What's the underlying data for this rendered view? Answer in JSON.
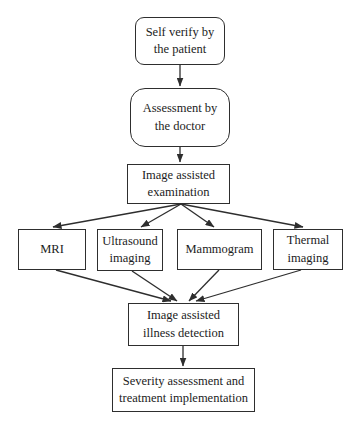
{
  "diagram": {
    "type": "flowchart",
    "colors": {
      "line": "#2e2e2e",
      "text": "#1c1c1c",
      "background": "#ffffff"
    },
    "nodes": {
      "self_verify": {
        "shape": "rounded-rect",
        "label": "Self verify by the patient",
        "lines": [
          "Self verify by",
          "the patient"
        ]
      },
      "assessment": {
        "shape": "rounded-rect",
        "label": "Assessment by the doctor",
        "lines": [
          "Assessment by",
          "the doctor"
        ]
      },
      "examination": {
        "shape": "rect",
        "label": "Image assisted examination",
        "lines": [
          "Image assisted",
          "examination"
        ]
      },
      "mri": {
        "shape": "rect",
        "label": "MRI",
        "lines": [
          "MRI"
        ]
      },
      "ultrasound": {
        "shape": "rect",
        "label": "Ultrasound imaging",
        "lines": [
          "Ultrasound",
          "imaging"
        ]
      },
      "mammogram": {
        "shape": "rect",
        "label": "Mammogram",
        "lines": [
          "Mammogram"
        ]
      },
      "thermal": {
        "shape": "rect",
        "label": "Thermal imaging",
        "lines": [
          "Thermal",
          "imaging"
        ]
      },
      "detection": {
        "shape": "rect",
        "label": "Image assisted illness detection",
        "lines": [
          "Image assisted",
          "illness detection"
        ]
      },
      "severity": {
        "shape": "rect",
        "label": "Severity assessment and treatment implementation",
        "lines": [
          "Severity assessment and",
          "treatment implementation"
        ]
      }
    },
    "edges": [
      {
        "from": "self_verify",
        "to": "assessment"
      },
      {
        "from": "assessment",
        "to": "examination"
      },
      {
        "from": "examination",
        "to": "mri"
      },
      {
        "from": "examination",
        "to": "ultrasound"
      },
      {
        "from": "examination",
        "to": "mammogram"
      },
      {
        "from": "examination",
        "to": "thermal"
      },
      {
        "from": "mri",
        "to": "detection"
      },
      {
        "from": "ultrasound",
        "to": "detection"
      },
      {
        "from": "mammogram",
        "to": "detection"
      },
      {
        "from": "thermal",
        "to": "detection"
      },
      {
        "from": "detection",
        "to": "severity"
      }
    ]
  }
}
